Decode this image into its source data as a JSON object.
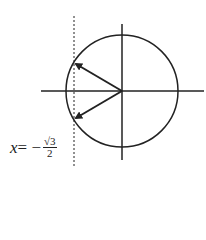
{
  "diagram": {
    "type": "unit-circle",
    "label": {
      "variable": "x",
      "equals": " = −",
      "numerator": "√3",
      "denominator": "2"
    },
    "geometry": {
      "center": [
        122,
        91
      ],
      "radius": 56,
      "dashed_line_x": 74,
      "vectors": [
        {
          "to": [
            74,
            63
          ],
          "direction": "150°"
        },
        {
          "to": [
            74,
            119
          ],
          "direction": "210°"
        }
      ]
    },
    "colors": {
      "stroke": "#222222",
      "background": "#ffffff"
    }
  }
}
